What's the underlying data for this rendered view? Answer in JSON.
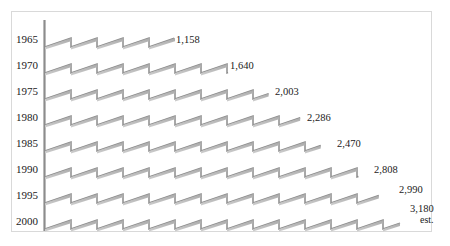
{
  "chart_data": {
    "type": "bar",
    "title": "",
    "subtitle": "",
    "xlabel": "",
    "ylabel": "",
    "orientation": "horizontal",
    "grid": false,
    "legend": null,
    "axis_line": "vertical category axis at left",
    "categories": [
      "1965",
      "1970",
      "1975",
      "1980",
      "1985",
      "1990",
      "1995",
      "2000"
    ],
    "values": [
      1158,
      1640,
      2003,
      2286,
      2470,
      2808,
      2990,
      3180
    ],
    "value_labels": [
      "1,158",
      "1,640",
      "2,003",
      "2,286",
      "2,470",
      "2,808",
      "2,990",
      "3,180"
    ],
    "annotations": [
      "est."
    ],
    "xlim": [
      0,
      3180
    ]
  },
  "axis": {
    "years": [
      {
        "label": "1965"
      },
      {
        "label": "1970"
      },
      {
        "label": "1975"
      },
      {
        "label": "1980"
      },
      {
        "label": "1985"
      },
      {
        "label": "1990"
      },
      {
        "label": "1995"
      },
      {
        "label": "2000"
      }
    ]
  },
  "bars": [
    {
      "year": "1965",
      "value_label": "1,158",
      "note": ""
    },
    {
      "year": "1970",
      "value_label": "1,640",
      "note": ""
    },
    {
      "year": "1975",
      "value_label": "2,003",
      "note": ""
    },
    {
      "year": "1980",
      "value_label": "2,286",
      "note": ""
    },
    {
      "year": "1985",
      "value_label": "2,470",
      "note": ""
    },
    {
      "year": "1990",
      "value_label": "2,808",
      "note": ""
    },
    {
      "year": "1995",
      "value_label": "2,990",
      "note": ""
    },
    {
      "year": "2000",
      "value_label": "3,180",
      "note": "est."
    }
  ],
  "colors": {
    "bar_stroke": "#8c8c8c",
    "bar_fill": "#b3b3b3",
    "axis_line": "#8c8c8c",
    "frame_border": "#d9d9d9",
    "text": "#1a1a1a",
    "background": "#ffffff"
  }
}
